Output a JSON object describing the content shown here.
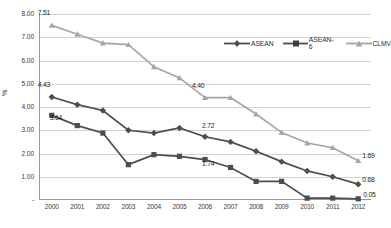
{
  "chart_data": {
    "type": "line",
    "title": "",
    "xlabel": "",
    "ylabel": "%",
    "categories": [
      "2000",
      "2001",
      "2002",
      "2003",
      "2004",
      "2005",
      "2006",
      "2007",
      "2008",
      "2009",
      "2010",
      "2011",
      "2012"
    ],
    "ylim": [
      0,
      8
    ],
    "ytick_labels": [
      "8.00",
      "7.00",
      "6.00",
      "5.00",
      "4.00",
      "3.00",
      "2.00",
      "1.00",
      "-"
    ],
    "ytick_values": [
      8,
      7,
      6,
      5,
      4,
      3,
      2,
      1,
      0
    ],
    "grid": true,
    "legend_position": "top-right",
    "series": [
      {
        "name": "ASEAN",
        "marker": "diamond",
        "color": "#4d4d4d",
        "values": [
          4.43,
          4.1,
          3.85,
          3.0,
          2.88,
          3.1,
          2.72,
          2.5,
          2.1,
          1.65,
          1.25,
          1.0,
          0.68
        ]
      },
      {
        "name": "ASEAN-6",
        "marker": "square",
        "color": "#4d4d4d",
        "values": [
          3.64,
          3.2,
          2.88,
          1.52,
          1.95,
          1.88,
          1.74,
          1.4,
          0.8,
          0.8,
          0.08,
          0.08,
          0.05
        ]
      },
      {
        "name": "CLMV",
        "marker": "triangle",
        "color": "#a6a6a6",
        "values": [
          7.51,
          7.13,
          6.75,
          6.68,
          5.73,
          5.25,
          4.4,
          4.4,
          3.7,
          2.9,
          2.45,
          2.25,
          1.69
        ]
      }
    ],
    "annotations": [
      {
        "text": "7.51",
        "series": "CLMV",
        "category": "2000"
      },
      {
        "text": "4.43",
        "series": "ASEAN",
        "category": "2000"
      },
      {
        "text": "3.64",
        "series": "ASEAN-6",
        "category": "2000"
      },
      {
        "text": "4.40",
        "series": "CLMV",
        "category": "2006"
      },
      {
        "text": "2.72",
        "series": "ASEAN",
        "category": "2006"
      },
      {
        "text": "1.74",
        "series": "ASEAN-6",
        "category": "2006"
      },
      {
        "text": "1.69",
        "series": "CLMV",
        "category": "2012"
      },
      {
        "text": "0.68",
        "series": "ASEAN",
        "category": "2012"
      },
      {
        "text": "0.05",
        "series": "ASEAN-6",
        "category": "2012"
      }
    ]
  },
  "legend": {
    "items": [
      {
        "label": "ASEAN"
      },
      {
        "label": "ASEAN-6"
      },
      {
        "label": "CLMV"
      }
    ]
  }
}
